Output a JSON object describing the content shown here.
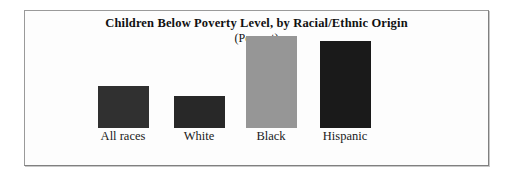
{
  "chart_data": {
    "type": "bar",
    "title": "Children Below Poverty Level, by Racial/Ethnic Origin",
    "subtitle": "(Percent)",
    "xlabel": "",
    "ylabel": "Percent",
    "grid": false,
    "legend": "none",
    "ylim": [
      0,
      45
    ],
    "categories": [
      "All races",
      "White",
      "Black",
      "Hispanic"
    ],
    "values": [
      19,
      15,
      42,
      40
    ],
    "bar_colors": [
      "#303030",
      "#282828",
      "#969696",
      "#1a1a1a"
    ],
    "bars": [
      {
        "label": "All races",
        "value": 19,
        "color": "#303030",
        "pixel_height": 42
      },
      {
        "label": "White",
        "value": 15,
        "color": "#282828",
        "pixel_height": 32
      },
      {
        "label": "Black",
        "value": 42,
        "color": "#969696",
        "pixel_height": 92
      },
      {
        "label": "Hispanic",
        "value": 40,
        "color": "#1a1a1a",
        "pixel_height": 87
      }
    ]
  },
  "frame": {
    "border_color": "#9a9a9a",
    "background": "#fdfdfd"
  }
}
